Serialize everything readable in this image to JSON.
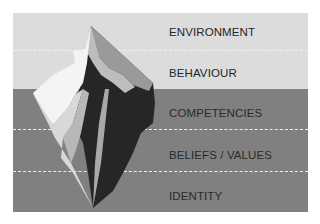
{
  "diagram": {
    "title": "",
    "type": "iceberg-levels",
    "levels": [
      {
        "label": "ENVIRONMENT",
        "zone": "above-water"
      },
      {
        "label": "BEHAVIOUR",
        "zone": "above-water"
      },
      {
        "label": "COMPETENCIES",
        "zone": "below-water"
      },
      {
        "label": "BELIEFS / VALUES",
        "zone": "below-water"
      },
      {
        "label": "IDENTITY",
        "zone": "below-water"
      }
    ],
    "colors": {
      "above_water": "#dcdcdc",
      "below_water": "#808080",
      "iceberg_light": "#f4f4f4",
      "iceberg_mid": "#b0b0b0",
      "iceberg_dark": "#262626"
    }
  }
}
